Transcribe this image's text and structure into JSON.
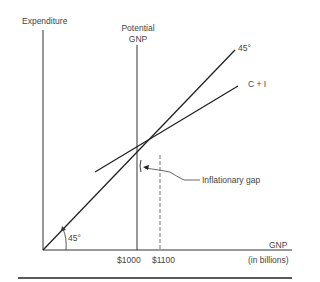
{
  "diagram": {
    "y_axis_label": "Expenditure",
    "x_axis_label": "GNP",
    "x_axis_unit": "(in billions)",
    "potential_gnp_label_line1": "Potential",
    "potential_gnp_label_line2": "GNP",
    "line_45_label": "45°",
    "line_ci_label": "C + I",
    "angle_label": "45°",
    "gap_label": "Inflationary gap",
    "tick_1000": "$1000",
    "tick_1100": "$1100",
    "colors": {
      "line": "#222222",
      "text": "#444444",
      "dashed": "#777777"
    }
  }
}
